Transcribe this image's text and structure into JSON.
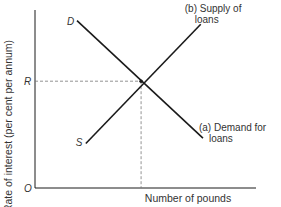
{
  "chart_data": {
    "type": "line",
    "title": "",
    "ylabel": "Rate of interest (per cent per annum)",
    "xlabel": "Number of pounds",
    "origin_label": "O",
    "equilibrium_rate_label": "R",
    "xlim": [
      0,
      100
    ],
    "ylim": [
      0,
      100
    ],
    "series": [
      {
        "name": "(a) Demand for loans",
        "label_lines": [
          "(a) Demand for",
          "loans"
        ],
        "start_label": "D",
        "points": [
          [
            19,
            94
          ],
          [
            76,
            28
          ]
        ]
      },
      {
        "name": "(b) Supply of loans",
        "label_lines": [
          "(b) Supply of",
          "loans"
        ],
        "start_label": "S",
        "points": [
          [
            23,
            25
          ],
          [
            75,
            92
          ]
        ]
      }
    ],
    "equilibrium": {
      "x": 48,
      "y": 60
    },
    "guides": "dashed lines from equilibrium to both axes"
  },
  "colors": {
    "line": "#1a1a1a",
    "text": "#333333",
    "guide": "#777777"
  }
}
